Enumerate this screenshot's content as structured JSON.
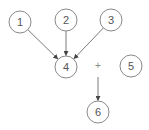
{
  "diagram": {
    "type": "directed-graph",
    "colors": {
      "background": "#ffffff",
      "node_stroke": "#8a8a8a",
      "node_fill": "#ffffff",
      "label": "#555555",
      "edge": "#7a7a7a",
      "arrowhead": "#444444"
    },
    "node_radius": 11,
    "nodes": [
      {
        "id": "1",
        "label": "1",
        "x": 20,
        "y": 22
      },
      {
        "id": "2",
        "label": "2",
        "x": 66,
        "y": 20
      },
      {
        "id": "3",
        "label": "3",
        "x": 111,
        "y": 20
      },
      {
        "id": "4",
        "label": "4",
        "x": 66,
        "y": 67
      },
      {
        "id": "5",
        "label": "5",
        "x": 131,
        "y": 66
      },
      {
        "id": "6",
        "label": "6",
        "x": 98,
        "y": 112
      }
    ],
    "edges": [
      {
        "from": "1",
        "to": "4"
      },
      {
        "from": "2",
        "to": "4"
      },
      {
        "from": "3",
        "to": "4"
      },
      {
        "from": "plus",
        "to": "6"
      }
    ],
    "operator": {
      "id": "plus",
      "label": "+",
      "x": 98,
      "y": 65
    }
  }
}
